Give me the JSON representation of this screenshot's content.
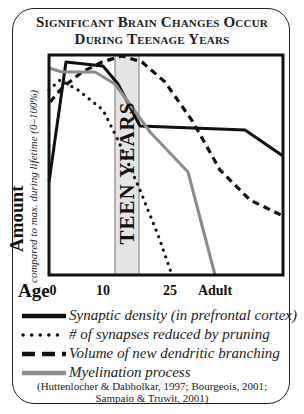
{
  "title": {
    "line1": "Significant Brain Changes Occur",
    "line2": "During Teenage Years"
  },
  "axes": {
    "y_label": "Amount",
    "y_sublabel": "compared to max. during lifetime (0–100%)",
    "x_label": "Age",
    "x_ticks": [
      {
        "label": "0",
        "x": 53
      },
      {
        "label": "10",
        "x": 103
      },
      {
        "label": "25",
        "x": 170
      },
      {
        "label": "Adult",
        "x": 215
      }
    ]
  },
  "teen_band": {
    "label": "TEEN YEARS",
    "fill": "#e4e4e4"
  },
  "legend": [
    {
      "label": "Synaptic density (in prefrontal cortex)",
      "style": "solid",
      "color": "#111111"
    },
    {
      "label": "# of synapses reduced by pruning",
      "style": "dotted",
      "color": "#111111"
    },
    {
      "label": "Volume of new dendritic branching",
      "style": "dashed",
      "color": "#111111"
    },
    {
      "label": "Myelination process",
      "style": "solid-gray",
      "color": "#8c8c8c"
    }
  ],
  "citation": {
    "line1": "(Huttenlocher & Dabholkar, 1997; Bourgeois, 2001;",
    "line2": "Sampaio & Truwit, 2001)"
  },
  "chart_data": {
    "type": "line",
    "title": "Significant Brain Changes Occur During Teenage Years",
    "xlabel": "Age",
    "ylabel": "Amount (compared to max. during lifetime (0–100%))",
    "x_tick_labels": [
      "0",
      "10",
      "25",
      "Adult"
    ],
    "ylim": [
      0,
      100
    ],
    "grid": false,
    "legend_position": "below",
    "annotations": [
      {
        "text": "TEEN YEARS",
        "x_range_px": [
          115,
          139
        ],
        "note": "shaded vertical band roughly ages 12–19"
      }
    ],
    "plot_box_px": {
      "left": 49,
      "right": 283,
      "top": 55,
      "bottom": 275
    },
    "series": [
      {
        "name": "Synaptic density (in prefrontal cortex)",
        "style": "solid",
        "color": "#111111",
        "points_px": [
          [
            49,
            182
          ],
          [
            66,
            62
          ],
          [
            103,
            66
          ],
          [
            118,
            84
          ],
          [
            140,
            126
          ],
          [
            245,
            130
          ],
          [
            283,
            156
          ]
        ],
        "approx_values_pct": [
          42,
          96,
          95,
          87,
          68,
          66,
          54
        ]
      },
      {
        "name": "# of synapses reduced by pruning",
        "style": "dotted",
        "color": "#111111",
        "points_px": [
          [
            49,
            90
          ],
          [
            60,
            80
          ],
          [
            78,
            90
          ],
          [
            103,
            110
          ],
          [
            118,
            140
          ],
          [
            140,
            190
          ],
          [
            158,
            235
          ],
          [
            172,
            275
          ]
        ],
        "approx_values_pct": [
          84,
          89,
          84,
          75,
          61,
          39,
          18,
          0
        ]
      },
      {
        "name": "Volume of new dendritic branching",
        "style": "dashed",
        "color": "#111111",
        "points_px": [
          [
            50,
            102
          ],
          [
            62,
            88
          ],
          [
            82,
            72
          ],
          [
            102,
            62
          ],
          [
            122,
            56
          ],
          [
            142,
            62
          ],
          [
            165,
            82
          ],
          [
            193,
            122
          ],
          [
            220,
            170
          ],
          [
            250,
            200
          ],
          [
            283,
            216
          ]
        ],
        "approx_values_pct": [
          79,
          85,
          92,
          97,
          100,
          97,
          88,
          70,
          48,
          34,
          27
        ]
      },
      {
        "name": "Myelination process",
        "style": "solid",
        "color": "#8c8c8c",
        "points_px": [
          [
            49,
            68
          ],
          [
            62,
            72
          ],
          [
            95,
            72
          ],
          [
            115,
            84
          ],
          [
            150,
            132
          ],
          [
            188,
            172
          ],
          [
            215,
            275
          ]
        ],
        "approx_values_pct": [
          94,
          92,
          92,
          87,
          65,
          47,
          0
        ]
      }
    ]
  }
}
